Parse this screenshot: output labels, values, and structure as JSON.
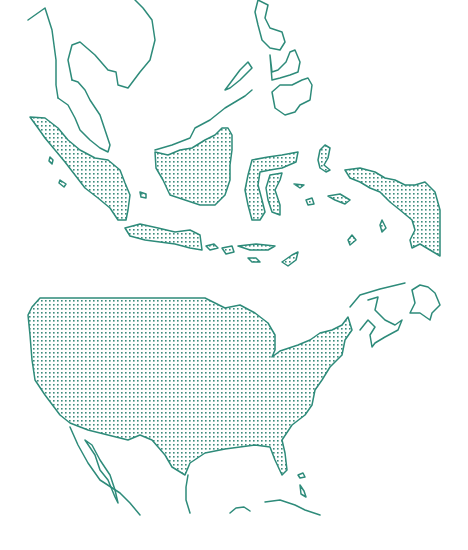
{
  "map": {
    "colors": {
      "stroke": "#2e8b7a",
      "dot": "#3c8c7c",
      "background": "#ffffff"
    },
    "panels": [
      {
        "id": "southeast-asia",
        "highlighted_region": "Indonesia",
        "outlined_context": [
          "Indochina",
          "Malay Peninsula",
          "Philippines",
          "Northern Borneo"
        ]
      },
      {
        "id": "north-america",
        "highlighted_region": "United States (contiguous)",
        "outlined_context": [
          "Mexico",
          "Baja California",
          "Cuba",
          "Bahamas",
          "Canadian Maritimes",
          "Newfoundland"
        ]
      }
    ]
  }
}
